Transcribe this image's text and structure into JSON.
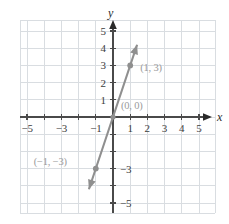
{
  "chart_data": {
    "type": "line",
    "title": "",
    "xlabel": "x",
    "ylabel": "y",
    "grid": true,
    "legend": null,
    "xlim": [
      -5.7,
      6.0
    ],
    "ylim": [
      -5.7,
      5.7
    ],
    "equation_slope": 3,
    "equation_intercept": 0,
    "series": [
      {
        "name": "line through origin, slope 3",
        "x": [
          -1.4,
          1.4
        ],
        "y": [
          -4.2,
          4.2
        ],
        "color": "#8f8f8f",
        "arrow_start": true,
        "arrow_end": true
      }
    ],
    "points": [
      {
        "label": "(1, 3)",
        "x": 1,
        "y": 3,
        "label_dx": 10,
        "label_dy": -2
      },
      {
        "label": "(0, 0)",
        "x": 0,
        "y": 0,
        "label_dx": 8,
        "label_dy": -16
      },
      {
        "label": "(−1, −3)",
        "x": -1,
        "y": -3,
        "label_dx": -62,
        "label_dy": -12
      }
    ],
    "x_tick_labels": [
      {
        "value": -5,
        "text": "−5"
      },
      {
        "value": -3,
        "text": "−3"
      },
      {
        "value": -1,
        "text": "−1"
      },
      {
        "value": 1,
        "text": "1"
      },
      {
        "value": 2,
        "text": "2"
      },
      {
        "value": 3,
        "text": "3"
      },
      {
        "value": 4,
        "text": "4"
      },
      {
        "value": 5,
        "text": "5"
      }
    ],
    "y_tick_labels": [
      {
        "value": 5,
        "text": "5"
      },
      {
        "value": 4,
        "text": "4"
      },
      {
        "value": 3,
        "text": "3"
      },
      {
        "value": 2,
        "text": "2"
      },
      {
        "value": 1,
        "text": "1"
      },
      {
        "value": -3,
        "text": "−3"
      },
      {
        "value": -5,
        "text": "−5"
      }
    ],
    "colors": {
      "grid": "#d9dde1",
      "axis": "#4a4a4a",
      "line": "#8f8f8f",
      "point": "#8f8f8f",
      "tick_text": "#3c3c3c",
      "point_label_text": "#9a9a9a",
      "background": "#ffffff"
    }
  }
}
